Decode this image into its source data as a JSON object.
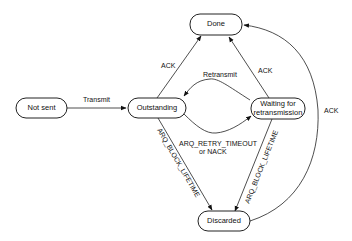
{
  "diagram": {
    "type": "state-diagram",
    "states": [
      {
        "id": "not_sent",
        "label": "Not sent"
      },
      {
        "id": "outstanding",
        "label": "Outstanding"
      },
      {
        "id": "done",
        "label": "Done"
      },
      {
        "id": "waiting",
        "label_line1": "Waiting for",
        "label_line2": "retransmission"
      },
      {
        "id": "discarded",
        "label": "Discarded"
      }
    ],
    "transitions": [
      {
        "from": "not_sent",
        "to": "outstanding",
        "label": "Transmit"
      },
      {
        "from": "outstanding",
        "to": "done",
        "label": "ACK"
      },
      {
        "from": "waiting",
        "to": "done",
        "label": "ACK"
      },
      {
        "from": "discarded",
        "to": "done",
        "label": "ACK"
      },
      {
        "from": "waiting",
        "to": "outstanding",
        "label": "Retransmit"
      },
      {
        "from": "outstanding",
        "to": "waiting",
        "label_line1": "ARQ_RETRY_TIMEOUT",
        "label_line2": "or NACK"
      },
      {
        "from": "outstanding",
        "to": "discarded",
        "label": "ARQ_BLOCK_LIFETIME"
      },
      {
        "from": "waiting",
        "to": "discarded",
        "label": "ARQ_BLOCK_LIFETIME"
      }
    ]
  }
}
